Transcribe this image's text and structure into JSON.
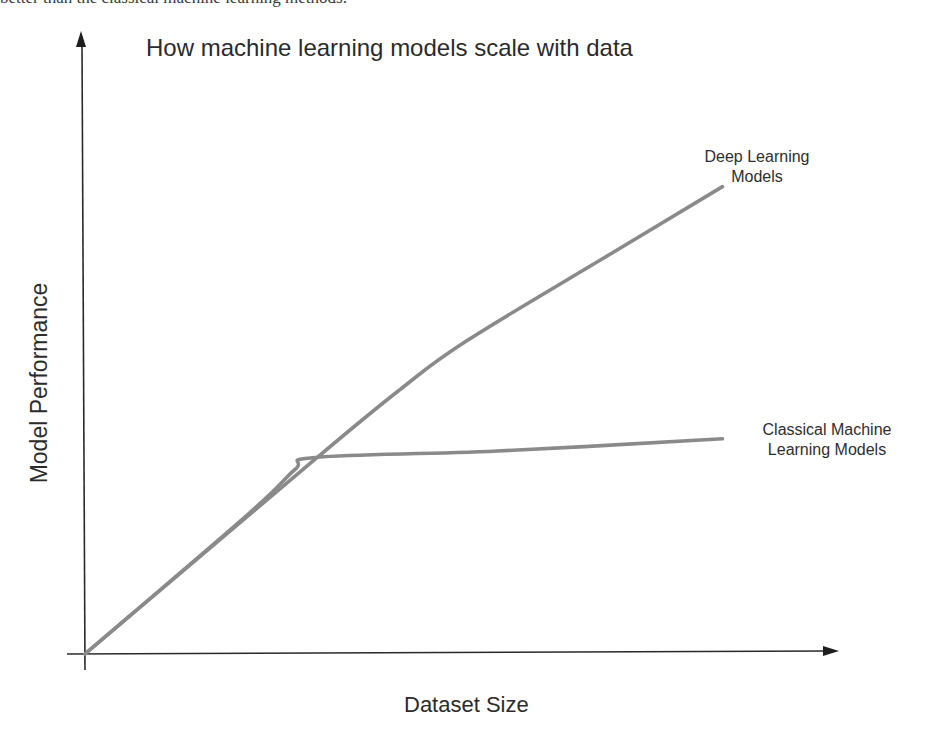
{
  "page": {
    "cutoff_text": "better than the classical machine learning methods."
  },
  "chart_data": {
    "type": "line",
    "title": "How machine learning models scale with data",
    "xlabel": "Dataset Size",
    "ylabel": "Model Performance",
    "grid": false,
    "ticks": "none",
    "legend": "inline labels at line ends",
    "xlim": [
      0,
      100
    ],
    "ylim": [
      0,
      100
    ],
    "series": [
      {
        "name": "Deep Learning Models",
        "label_lines": [
          "Deep Learning",
          "Models"
        ],
        "color": "#8a8a8a",
        "x": [
          0,
          31,
          42,
          51,
          70,
          85
        ],
        "y": [
          0,
          32,
          43,
          51,
          65,
          76
        ]
      },
      {
        "name": "Classical Machine Learning Models",
        "label_lines": [
          "Classical Machine",
          "Learning Models"
        ],
        "color": "#8a8a8a",
        "x": [
          0,
          22,
          28,
          31,
          55,
          85
        ],
        "y": [
          0,
          23,
          30,
          32,
          33,
          35
        ]
      }
    ],
    "annotations": [
      "Curves cross near x=31, y=32"
    ]
  },
  "colors": {
    "axis": "#2a2a2a",
    "line": "#8a8a8a",
    "text": "#2b2b2b"
  }
}
